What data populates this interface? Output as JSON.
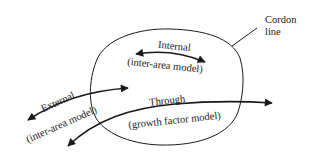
{
  "diagram": {
    "type": "cordon-trip-classification",
    "cordon": {
      "label_line1": "Cordon",
      "label_line2": "line"
    },
    "trips": {
      "internal": {
        "label": "Internal",
        "model": "(inter-area model)"
      },
      "external": {
        "label": "External",
        "model": "(inter-area model)"
      },
      "through": {
        "label": "Through",
        "model": "(growth factor model)"
      }
    },
    "colors": {
      "ink": "#1a1a1a",
      "background": "#ffffff"
    }
  }
}
